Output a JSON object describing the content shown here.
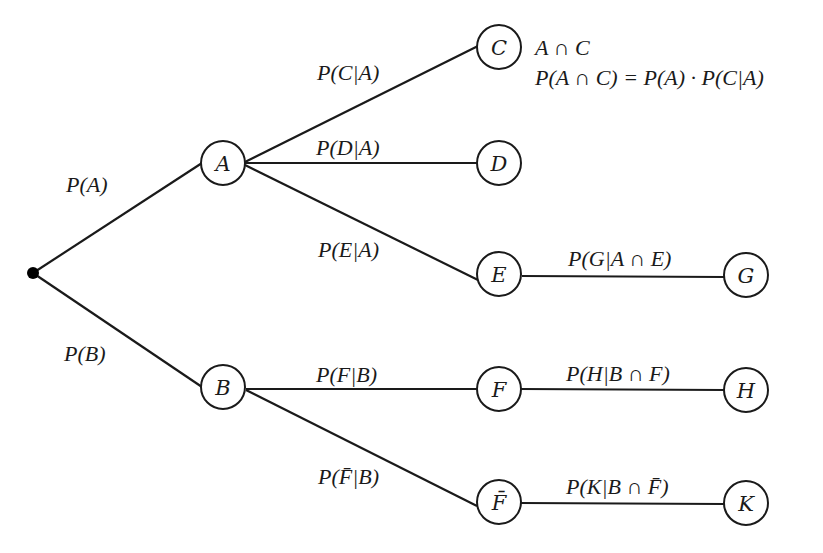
{
  "diagram": {
    "type": "probability-tree",
    "root": {
      "x": 33,
      "y": 273
    },
    "nodes": [
      {
        "id": "A",
        "label": "A",
        "x": 223,
        "y": 163
      },
      {
        "id": "B",
        "label": "B",
        "x": 223,
        "y": 387
      },
      {
        "id": "C",
        "label": "C",
        "x": 499,
        "y": 47
      },
      {
        "id": "D",
        "label": "D",
        "x": 499,
        "y": 163
      },
      {
        "id": "E",
        "label": "E",
        "x": 499,
        "y": 273
      },
      {
        "id": "F",
        "label": "F",
        "x": 499,
        "y": 388
      },
      {
        "id": "Fbar",
        "label": "F̄",
        "x": 499,
        "y": 501
      },
      {
        "id": "G",
        "label": "G",
        "x": 746,
        "y": 274
      },
      {
        "id": "H",
        "label": "H",
        "x": 746,
        "y": 389
      },
      {
        "id": "K",
        "label": "K",
        "x": 746,
        "y": 502
      }
    ],
    "edges": [
      {
        "from": "root",
        "to": "A",
        "label": "P(A)"
      },
      {
        "from": "root",
        "to": "B",
        "label": "P(B)"
      },
      {
        "from": "A",
        "to": "C",
        "label": "P(C|A)"
      },
      {
        "from": "A",
        "to": "D",
        "label": "P(D|A)"
      },
      {
        "from": "A",
        "to": "E",
        "label": "P(E|A)"
      },
      {
        "from": "E",
        "to": "G",
        "label": "P(G|A ∩ E)"
      },
      {
        "from": "B",
        "to": "F",
        "label": "P(F|B)"
      },
      {
        "from": "B",
        "to": "Fbar",
        "label": "P(F̄|B)"
      },
      {
        "from": "F",
        "to": "H",
        "label": "P(H|B ∩ F)"
      },
      {
        "from": "Fbar",
        "to": "K",
        "label": "P(K|B ∩ F̄)"
      }
    ],
    "annotation": {
      "line1": "A ∩ C",
      "line2": "P(A ∩ C) = P(A) · P(C|A)"
    }
  }
}
